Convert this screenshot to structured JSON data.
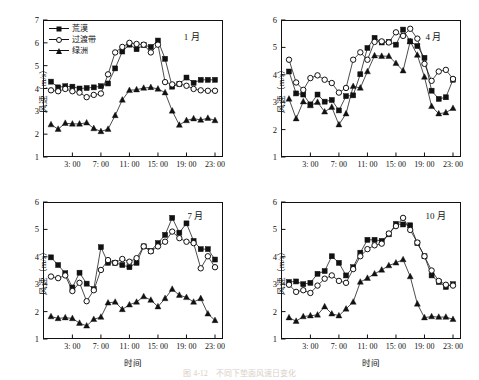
{
  "figure": {
    "caption": "图 4-12　不同下垫面风速日变化",
    "legend": [
      {
        "label": "荒漠",
        "marker": "filled-square"
      },
      {
        "label": "过渡带",
        "marker": "open-circle"
      },
      {
        "label": "绿洲",
        "marker": "filled-triangle"
      }
    ],
    "axis_labels": {
      "y": "风速（m/s）",
      "x": "时间"
    }
  },
  "chart_data": [
    {
      "type": "line",
      "panel": "top-left",
      "title": "1 月",
      "xlabel": "",
      "ylabel": "风速（m/s）",
      "ylim": [
        1,
        7
      ],
      "yticks": [
        1,
        2,
        3,
        4,
        5,
        6,
        7
      ],
      "xlim": [
        0,
        23
      ],
      "xticks": [
        3,
        7,
        11,
        15,
        19,
        23
      ],
      "xticklabels": [
        "3: 00",
        "7: 00",
        "11: 00",
        "15: 00",
        "19: 00",
        "23: 00"
      ],
      "x": [
        0,
        1,
        2,
        3,
        4,
        5,
        6,
        7,
        8,
        9,
        10,
        11,
        12,
        13,
        14,
        15,
        16,
        17,
        18,
        19,
        20,
        21,
        22,
        23
      ],
      "grid": false,
      "series": [
        {
          "name": "荒漠",
          "marker": "filled-square",
          "values": [
            4.3,
            4.05,
            4.1,
            4.08,
            4.0,
            4.02,
            4.05,
            4.1,
            4.22,
            4.88,
            5.62,
            5.92,
            5.72,
            5.9,
            5.82,
            6.1,
            5.3,
            4.08,
            4.2,
            4.48,
            4.25,
            4.38,
            4.38,
            4.38
          ]
        },
        {
          "name": "过渡带",
          "marker": "open-circle",
          "values": [
            3.92,
            3.88,
            3.98,
            3.88,
            3.82,
            3.62,
            3.72,
            3.78,
            4.62,
            5.58,
            5.82,
            6.0,
            5.95,
            5.92,
            5.58,
            5.92,
            4.28,
            4.18,
            4.2,
            4.12,
            3.98,
            3.92,
            3.9,
            3.9
          ]
        },
        {
          "name": "绿洲",
          "marker": "filled-triangle",
          "values": [
            2.42,
            2.22,
            2.48,
            2.45,
            2.45,
            2.5,
            2.25,
            2.12,
            2.22,
            2.82,
            3.5,
            3.92,
            3.95,
            4.02,
            4.05,
            3.98,
            3.82,
            3.02,
            2.4,
            2.6,
            2.68,
            2.62,
            2.7,
            2.6
          ]
        }
      ]
    },
    {
      "type": "line",
      "panel": "top-right",
      "title": "4 月",
      "xlabel": "",
      "ylabel": "风速（m/s）",
      "ylim": [
        1,
        6
      ],
      "yticks": [
        1,
        2,
        3,
        4,
        5,
        6
      ],
      "xlim": [
        0,
        23
      ],
      "xticks": [
        3,
        7,
        11,
        15,
        19,
        23
      ],
      "xticklabels": [
        "3: 00",
        "7: 00",
        "11: 00",
        "15: 00",
        "19: 00",
        "23: 00"
      ],
      "x": [
        0,
        1,
        2,
        3,
        4,
        5,
        6,
        7,
        8,
        9,
        10,
        11,
        12,
        13,
        14,
        15,
        16,
        17,
        18,
        19,
        20,
        21,
        22,
        23
      ],
      "grid": false,
      "series": [
        {
          "name": "荒漠",
          "marker": "filled-square",
          "values": [
            4.12,
            3.32,
            3.28,
            2.92,
            3.28,
            3.02,
            3.08,
            2.7,
            3.22,
            3.25,
            4.02,
            4.98,
            5.35,
            5.18,
            5.2,
            5.1,
            5.65,
            5.22,
            5.05,
            4.62,
            3.42,
            3.12,
            3.18,
            3.82
          ]
        },
        {
          "name": "过渡带",
          "marker": "open-circle",
          "values": [
            4.55,
            3.72,
            3.45,
            3.88,
            3.98,
            3.82,
            3.7,
            3.35,
            3.52,
            4.55,
            4.82,
            4.55,
            5.2,
            5.22,
            5.18,
            5.55,
            5.42,
            5.68,
            5.32,
            4.4,
            3.78,
            4.12,
            4.18,
            3.85
          ]
        },
        {
          "name": "绿洲",
          "marker": "filled-triangle",
          "values": [
            3.12,
            2.4,
            3.02,
            2.88,
            3.0,
            2.65,
            2.82,
            2.18,
            2.58,
            3.58,
            3.52,
            4.12,
            4.7,
            4.68,
            4.68,
            4.42,
            4.15,
            5.22,
            4.72,
            3.92,
            2.85,
            2.58,
            2.62,
            2.78
          ]
        }
      ]
    },
    {
      "type": "line",
      "panel": "bottom-left",
      "title": "7 月",
      "xlabel": "时间",
      "ylabel": "风速（m/s）",
      "ylim": [
        1,
        6
      ],
      "yticks": [
        1,
        2,
        3,
        4,
        5,
        6
      ],
      "xlim": [
        0,
        23
      ],
      "xticks": [
        3,
        7,
        11,
        15,
        19,
        23
      ],
      "xticklabels": [
        "3: 00",
        "7: 00",
        "11: 00",
        "15: 00",
        "19: 00",
        "23: 00"
      ],
      "x": [
        0,
        1,
        2,
        3,
        4,
        5,
        6,
        7,
        8,
        9,
        10,
        11,
        12,
        13,
        14,
        15,
        16,
        17,
        18,
        19,
        20,
        21,
        22,
        23
      ],
      "grid": false,
      "series": [
        {
          "name": "荒漠",
          "marker": "filled-square",
          "values": [
            3.98,
            3.7,
            3.4,
            2.88,
            3.42,
            3.02,
            2.82,
            4.35,
            3.78,
            3.78,
            3.7,
            3.62,
            3.78,
            4.38,
            4.22,
            4.5,
            4.8,
            5.42,
            4.88,
            5.22,
            4.58,
            4.28,
            4.28,
            3.9
          ]
        },
        {
          "name": "过渡带",
          "marker": "open-circle",
          "values": [
            3.28,
            3.22,
            3.32,
            2.75,
            3.05,
            2.38,
            2.78,
            3.52,
            3.88,
            3.78,
            3.92,
            3.82,
            3.95,
            4.38,
            4.2,
            4.38,
            4.55,
            4.92,
            4.68,
            4.55,
            4.5,
            3.58,
            4.02,
            3.62
          ]
        },
        {
          "name": "绿洲",
          "marker": "filled-triangle",
          "values": [
            1.82,
            1.75,
            1.78,
            1.75,
            1.58,
            1.48,
            1.72,
            1.8,
            2.32,
            2.35,
            2.08,
            2.25,
            2.35,
            2.55,
            2.42,
            2.18,
            2.48,
            2.82,
            2.6,
            2.52,
            2.35,
            2.48,
            1.92,
            1.68,
            1.98
          ]
        }
      ]
    },
    {
      "type": "line",
      "panel": "bottom-right",
      "title": "10 月",
      "xlabel": "时间",
      "ylabel": "风速（m/s）",
      "ylim": [
        1,
        6
      ],
      "yticks": [
        1,
        2,
        3,
        4,
        5,
        6
      ],
      "xlim": [
        0,
        23
      ],
      "xticks": [
        3,
        7,
        11,
        15,
        19,
        23
      ],
      "xticklabels": [
        "3: 00",
        "7: 00",
        "11: 00",
        "15: 00",
        "19: 00",
        "23: 00"
      ],
      "x": [
        0,
        1,
        2,
        3,
        4,
        5,
        6,
        7,
        8,
        9,
        10,
        11,
        12,
        13,
        14,
        15,
        16,
        17,
        18,
        19,
        20,
        21,
        22,
        23
      ],
      "grid": false,
      "series": [
        {
          "name": "荒漠",
          "marker": "filled-square",
          "values": [
            3.08,
            3.1,
            3.0,
            3.05,
            3.38,
            3.48,
            4.02,
            3.78,
            3.32,
            3.62,
            4.15,
            4.62,
            4.62,
            4.58,
            4.82,
            5.2,
            5.18,
            5.15,
            4.5,
            4.02,
            3.32,
            3.08,
            2.9,
            3.0
          ]
        },
        {
          "name": "过渡带",
          "marker": "open-circle",
          "values": [
            2.98,
            2.72,
            2.78,
            2.68,
            2.95,
            3.2,
            3.32,
            3.12,
            3.05,
            3.55,
            4.02,
            4.28,
            4.42,
            4.48,
            4.85,
            5.12,
            5.42,
            4.98,
            4.52,
            4.02,
            3.5,
            3.12,
            2.98,
            2.95
          ]
        },
        {
          "name": "绿洲",
          "marker": "filled-triangle",
          "values": [
            1.78,
            1.65,
            1.82,
            1.85,
            1.88,
            2.18,
            1.92,
            1.85,
            2.1,
            2.35,
            3.08,
            3.22,
            3.38,
            3.52,
            3.68,
            3.78,
            3.9,
            3.28,
            2.28,
            1.78,
            1.82,
            1.8,
            1.8,
            1.72
          ]
        }
      ]
    }
  ]
}
